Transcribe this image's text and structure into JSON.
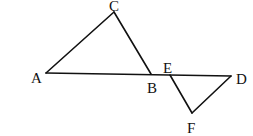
{
  "diagram": {
    "points": {
      "A": {
        "label": "A",
        "x": 46,
        "y": 73
      },
      "B": {
        "label": "B",
        "x": 151,
        "y": 74
      },
      "C": {
        "label": "C",
        "x": 114,
        "y": 12
      },
      "D": {
        "label": "D",
        "x": 231,
        "y": 76
      },
      "E": {
        "label": "E",
        "x": 170,
        "y": 75
      },
      "F": {
        "label": "F",
        "x": 192,
        "y": 113
      }
    },
    "segments": [
      [
        "A",
        "C"
      ],
      [
        "C",
        "B"
      ],
      [
        "A",
        "D"
      ],
      [
        "E",
        "F"
      ],
      [
        "F",
        "D"
      ]
    ],
    "triangles": [
      "ABC",
      "EDF"
    ],
    "colors": {
      "stroke": "#111111",
      "background": "#ffffff"
    }
  }
}
